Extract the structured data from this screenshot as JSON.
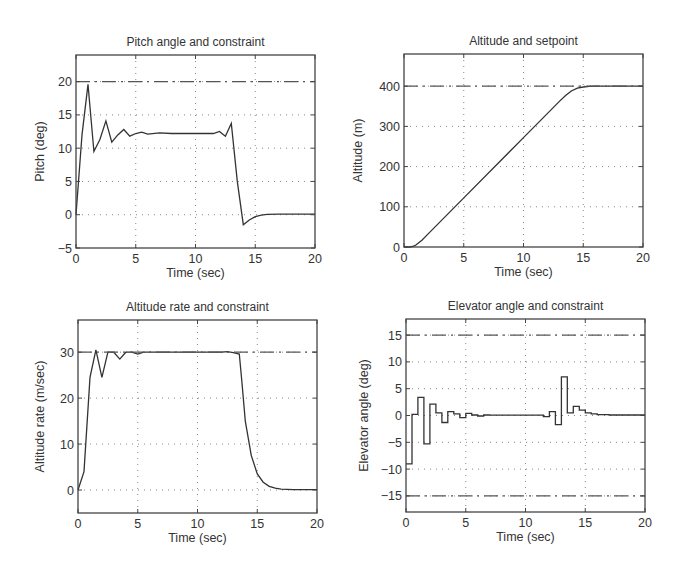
{
  "chart_data": [
    {
      "type": "line",
      "title": "Pitch angle and constraint",
      "xlabel": "Time (sec)",
      "ylabel": "Pitch (deg)",
      "xlim": [
        0,
        20
      ],
      "ylim": [
        -5,
        24
      ],
      "xticks": [
        0,
        5,
        10,
        15,
        20
      ],
      "yticks": [
        -5,
        0,
        5,
        10,
        15,
        20
      ],
      "grid": true,
      "frame": {
        "left": 76,
        "right": 315,
        "top": 55,
        "bottom": 248
      },
      "series": [
        {
          "name": "Pitch",
          "style": "solid",
          "x": [
            0,
            0.5,
            1.0,
            1.5,
            2.0,
            2.5,
            3.0,
            3.5,
            4.0,
            4.5,
            5.0,
            5.5,
            6.0,
            7.0,
            8.0,
            9.0,
            10.0,
            11.0,
            11.5,
            12.0,
            12.5,
            13.0,
            13.5,
            14.0,
            14.5,
            15.0,
            15.5,
            16.0,
            17.0,
            20.0
          ],
          "y": [
            0,
            12,
            19.6,
            9.5,
            11.3,
            14.1,
            10.9,
            12.0,
            12.8,
            11.8,
            12.2,
            12.4,
            12.1,
            12.3,
            12.2,
            12.2,
            12.2,
            12.2,
            12.2,
            12.5,
            11.8,
            13.7,
            5.0,
            -1.5,
            -0.8,
            -0.3,
            -0.05,
            0.05,
            0.1,
            0.1
          ]
        },
        {
          "name": "Pitch constraint",
          "style": "dashdot",
          "x": [
            0,
            20
          ],
          "y": [
            20,
            20
          ]
        }
      ]
    },
    {
      "type": "line",
      "title": "Altitude and setpoint",
      "xlabel": "Time (sec)",
      "ylabel": "Altitude (m)",
      "xlim": [
        0,
        20
      ],
      "ylim": [
        0,
        480
      ],
      "xticks": [
        0,
        5,
        10,
        15,
        20
      ],
      "yticks": [
        0,
        100,
        200,
        300,
        400
      ],
      "grid": true,
      "frame": {
        "left": 404,
        "right": 643,
        "top": 54,
        "bottom": 247
      },
      "series": [
        {
          "name": "Altitude",
          "style": "solid",
          "x": [
            0,
            0.5,
            0.8,
            1.0,
            1.5,
            2.0,
            5.0,
            10.0,
            13.0,
            13.5,
            14.0,
            14.5,
            15.0,
            15.5,
            16.0,
            20.0
          ],
          "y": [
            0,
            0,
            2,
            5,
            17,
            32,
            122,
            272,
            362,
            376,
            388,
            395,
            398,
            399.5,
            400,
            400
          ]
        },
        {
          "name": "Setpoint",
          "style": "dashdot",
          "x": [
            0,
            20
          ],
          "y": [
            400,
            400
          ]
        }
      ]
    },
    {
      "type": "line",
      "title": "Altitude rate and constraint",
      "xlabel": "Time (sec)",
      "ylabel": "Altitude rate (m/sec)",
      "xlim": [
        0,
        20
      ],
      "ylim": [
        -5,
        37
      ],
      "xticks": [
        0,
        5,
        10,
        15,
        20
      ],
      "yticks": [
        0,
        10,
        20,
        30
      ],
      "grid": true,
      "frame": {
        "left": 78,
        "right": 317,
        "top": 320,
        "bottom": 513
      },
      "series": [
        {
          "name": "Altitude rate",
          "style": "solid",
          "x": [
            0,
            0.5,
            1.0,
            1.5,
            2.0,
            2.5,
            3.0,
            3.5,
            4.0,
            4.5,
            5.0,
            5.5,
            6.0,
            10.0,
            12.0,
            12.5,
            13.0,
            13.5,
            13.7,
            14.0,
            14.5,
            15.0,
            15.5,
            16.0,
            16.5,
            17.0,
            18.0,
            20.0
          ],
          "y": [
            0,
            4,
            24.5,
            30.5,
            24.5,
            30.0,
            30.0,
            28.5,
            30.0,
            30.0,
            29.6,
            30.0,
            30.0,
            30.0,
            30.0,
            30.1,
            29.9,
            29.6,
            24.0,
            15.0,
            7.5,
            3.5,
            1.7,
            0.8,
            0.4,
            0.2,
            0.1,
            0.1
          ]
        },
        {
          "name": "Rate constraint",
          "style": "dashdot",
          "x": [
            0,
            20
          ],
          "y": [
            30,
            30
          ]
        }
      ]
    },
    {
      "type": "line",
      "title": "Elevator angle and constraint",
      "xlabel": "Time (sec)",
      "ylabel": "Elevator angle (deg)",
      "xlim": [
        0,
        20
      ],
      "ylim": [
        -18,
        18
      ],
      "xticks": [
        0,
        5,
        10,
        15,
        20
      ],
      "yticks": [
        -15,
        -10,
        -5,
        0,
        5,
        10,
        15
      ],
      "grid": true,
      "frame": {
        "left": 406,
        "right": 645,
        "top": 319,
        "bottom": 512
      },
      "series": [
        {
          "name": "Elevator angle",
          "style": "step",
          "x": [
            0,
            0.5,
            1.0,
            1.5,
            2.0,
            2.5,
            3.0,
            3.5,
            4.0,
            4.5,
            5.0,
            5.5,
            6.0,
            6.5,
            7.0,
            11.5,
            12.0,
            12.5,
            13.0,
            13.5,
            14.0,
            14.5,
            15.0,
            15.5,
            16.0,
            17.0,
            20.0
          ],
          "y": [
            -9.0,
            0.2,
            3.4,
            -5.3,
            2.1,
            0.5,
            -1.3,
            0.7,
            0.3,
            -0.4,
            0.4,
            0.1,
            -0.1,
            0.1,
            0.05,
            -0.2,
            0.7,
            -1.7,
            7.2,
            0.5,
            1.7,
            1.0,
            0.5,
            0.3,
            0.15,
            0.1,
            0.1
          ]
        },
        {
          "name": "Upper constraint",
          "style": "dashdot",
          "x": [
            0,
            20
          ],
          "y": [
            15,
            15
          ]
        },
        {
          "name": "Lower constraint",
          "style": "dashdot",
          "x": [
            0,
            20
          ],
          "y": [
            -15,
            -15
          ]
        }
      ]
    }
  ]
}
